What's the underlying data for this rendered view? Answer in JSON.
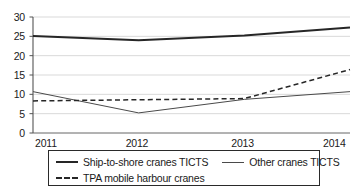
{
  "chart_data": {
    "type": "line",
    "title": "",
    "xlabel": "",
    "ylabel": "",
    "x": [
      "2011",
      "2012",
      "2013",
      "2014"
    ],
    "categories": [
      "2011",
      "2012",
      "2013",
      "2014"
    ],
    "ylim": [
      0,
      30
    ],
    "yticks": [
      0,
      5,
      10,
      15,
      20,
      25,
      30
    ],
    "ytick_labels": [
      "0",
      "5",
      "10",
      "15",
      "20",
      "25",
      "30"
    ],
    "xtick_labels": [
      "2011",
      "2012",
      "2013",
      "2014"
    ],
    "grid": "horizontal",
    "legend_position": "below-plot",
    "series": [
      {
        "name": "Ship-to-shore cranes TICTS",
        "values": [
          25.1,
          24.0,
          25.2,
          27.3
        ],
        "style": "solid-thick",
        "color": "#262626"
      },
      {
        "name": "Other cranes TICTS",
        "values": [
          10.7,
          5.2,
          8.7,
          10.7
        ],
        "style": "solid-thin",
        "color": "#4a4a4a"
      },
      {
        "name": "TPA mobile harbour cranes",
        "values": [
          8.3,
          8.6,
          8.9,
          16.4
        ],
        "style": "dashed",
        "color": "#262626"
      }
    ]
  },
  "legend": {
    "items": [
      {
        "label": "Ship-to-shore cranes TICTS",
        "swatch": "solid-thick-line-icon"
      },
      {
        "label": "Other cranes TICTS",
        "swatch": "solid-thin-line-icon"
      },
      {
        "label": "TPA mobile harbour cranes",
        "swatch": "dashed-line-icon"
      }
    ]
  },
  "axis": {
    "y_labels": [
      "30",
      "25",
      "20",
      "15",
      "10",
      "5",
      "0"
    ],
    "x_labels": [
      "2011",
      "2012",
      "2013",
      "2014"
    ]
  },
  "colors": {
    "ink": "#1a1a1a",
    "series_primary": "#262626",
    "series_secondary": "#4a4a4a",
    "grid": "#c9c9c9",
    "axis": "#555555",
    "background": "#ffffff"
  }
}
